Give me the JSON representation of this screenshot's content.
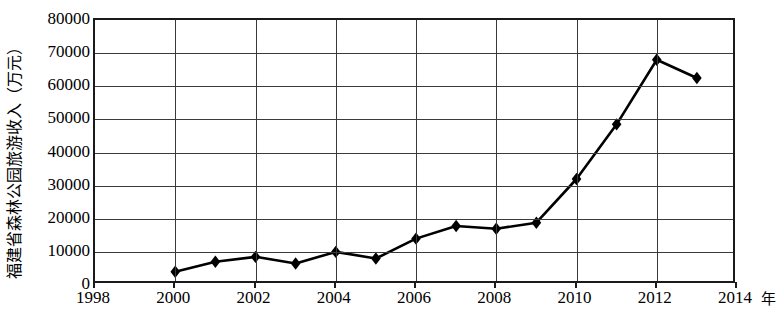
{
  "chart_data": {
    "type": "line",
    "title": "",
    "subtitle": "",
    "ylabel": "福建省森林公园旅游收入（万元）",
    "xlabel": "",
    "x_unit": "年",
    "x": [
      2000,
      2001,
      2002,
      2003,
      2004,
      2005,
      2006,
      2007,
      2008,
      2009,
      2010,
      2011,
      2012,
      2013
    ],
    "values": [
      4000,
      7000,
      8500,
      6500,
      10000,
      8000,
      14000,
      17800,
      17000,
      18800,
      32000,
      48500,
      68000,
      62500
    ],
    "series": [
      {
        "name": "福建省森林公园旅游收入",
        "values": [
          4000,
          7000,
          8500,
          6500,
          10000,
          8000,
          14000,
          17800,
          17000,
          18800,
          32000,
          48500,
          68000,
          62500
        ]
      }
    ],
    "xlim": [
      1998,
      2014
    ],
    "ylim": [
      0,
      80000
    ],
    "x_tick_labels": [
      "1998",
      "2000",
      "2002",
      "2004",
      "2006",
      "2008",
      "2010",
      "2012",
      "2014"
    ],
    "x_tick_values": [
      1998,
      2000,
      2002,
      2004,
      2006,
      2008,
      2010,
      2012,
      2014
    ],
    "y_tick_labels": [
      "0",
      "10000",
      "20000",
      "30000",
      "40000",
      "50000",
      "60000",
      "70000",
      "80000"
    ],
    "y_tick_values": [
      0,
      10000,
      20000,
      30000,
      40000,
      50000,
      60000,
      70000,
      80000
    ],
    "grid": "both",
    "legend": "none",
    "marker": "diamond",
    "line_color": "#000000",
    "marker_color": "#000000",
    "grid_color": "#3a3a3a",
    "frame_color": "#1a1a1a",
    "background": "#ffffff"
  }
}
